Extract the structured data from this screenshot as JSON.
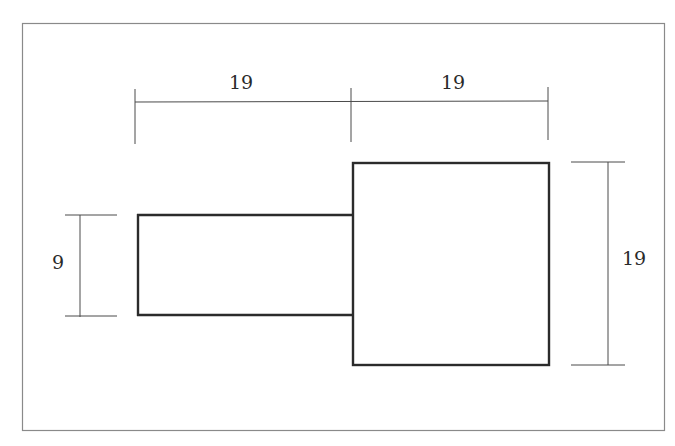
{
  "diagram": {
    "type": "dimensioned-technical-drawing",
    "colors": {
      "background": "#ffffff",
      "frame": "#8a8a8a",
      "outline": "#2b2b2b",
      "dimension_line": "#4a4a4a",
      "text": "#2a2a2a"
    },
    "shapes": [
      {
        "name": "small-rectangle",
        "width_units": 19,
        "height_units": 9
      },
      {
        "name": "large-square",
        "width_units": 19,
        "height_units": 19
      }
    ],
    "dimensions": {
      "top_left": "19",
      "top_right": "19",
      "left": "9",
      "right": "19"
    }
  }
}
